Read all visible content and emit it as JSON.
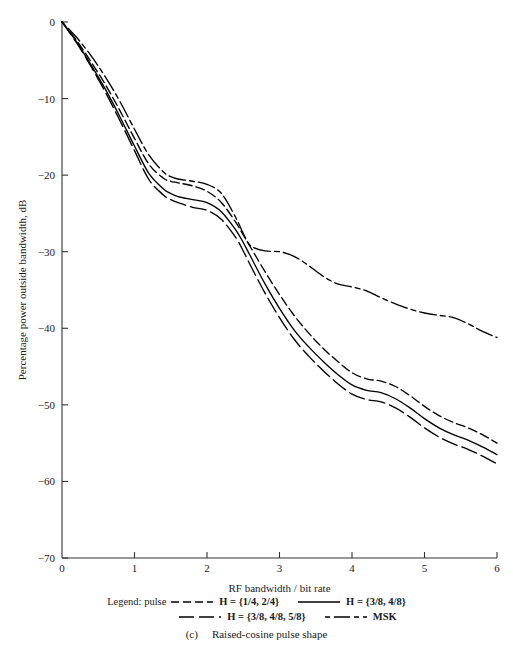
{
  "figure": {
    "caption_letter": "(c)",
    "caption_text": "Raised-cosine pulse shape"
  },
  "legend": {
    "title": "Legend: pulse",
    "entries": [
      {
        "label": "H = {1/4, 2/4}",
        "style": "dashed-medium",
        "row": 1
      },
      {
        "label": "H = {3/8, 4/8}",
        "style": "solid",
        "row": 1
      },
      {
        "label": "H = {3/8, 4/8, 5/8}",
        "style": "dashed-long",
        "row": 2
      },
      {
        "label": "MSK",
        "style": "dash-dot",
        "row": 2
      }
    ]
  },
  "chart_data": {
    "type": "line",
    "title": "",
    "xlabel": "RF bandwidth / bit rate",
    "ylabel": "Percentage power outside bandwidth, dB",
    "xlim": [
      0,
      6
    ],
    "ylim": [
      -70,
      0
    ],
    "xticks": [
      0,
      1,
      2,
      3,
      4,
      5,
      6
    ],
    "xticklabels": [
      "0",
      "1",
      "2",
      "3",
      "4",
      "5",
      "6"
    ],
    "yticks": [
      0,
      -10,
      -20,
      -30,
      -40,
      -50,
      -60,
      -70
    ],
    "yticklabels": [
      "0",
      "−10",
      "−20",
      "−30",
      "−40",
      "−50",
      "−60",
      "−70"
    ],
    "grid": false,
    "legend_position": "below-axes",
    "series": [
      {
        "name": "H = {1/4, 2/4}",
        "style": "dashed-medium",
        "x": [
          0,
          0.2,
          0.4,
          0.6,
          0.8,
          1.0,
          1.2,
          1.4,
          1.5,
          1.6,
          1.8,
          2.0,
          2.2,
          2.4,
          2.5,
          2.6,
          2.8,
          3.0,
          3.2,
          3.4,
          3.6,
          3.8,
          4.0,
          4.2,
          4.4,
          4.6,
          4.8,
          5.0,
          5.2,
          5.4,
          5.6,
          5.8,
          6.0
        ],
        "y": [
          0,
          -2.4,
          -5.2,
          -8.2,
          -11.6,
          -15.2,
          -18.6,
          -20.4,
          -20.8,
          -21.0,
          -21.4,
          -22.1,
          -23.6,
          -26.2,
          -27.8,
          -29.4,
          -32.6,
          -35.6,
          -38.3,
          -40.6,
          -42.6,
          -44.3,
          -45.8,
          -46.6,
          -46.9,
          -47.6,
          -48.8,
          -50.2,
          -51.4,
          -52.3,
          -53.0,
          -53.9,
          -55.0
        ]
      },
      {
        "name": "H = {3/8, 4/8}",
        "style": "solid",
        "x": [
          0,
          0.2,
          0.4,
          0.6,
          0.8,
          1.0,
          1.2,
          1.4,
          1.5,
          1.6,
          1.8,
          2.0,
          2.2,
          2.4,
          2.5,
          2.6,
          2.8,
          3.0,
          3.2,
          3.4,
          3.6,
          3.8,
          4.0,
          4.2,
          4.4,
          4.6,
          4.8,
          5.0,
          5.2,
          5.4,
          5.6,
          5.8,
          6.0
        ],
        "y": [
          0,
          -2.6,
          -5.6,
          -8.8,
          -12.4,
          -16.2,
          -19.8,
          -21.8,
          -22.4,
          -22.8,
          -23.2,
          -23.6,
          -24.8,
          -27.2,
          -28.8,
          -30.6,
          -34.2,
          -37.4,
          -40.2,
          -42.4,
          -44.3,
          -46.0,
          -47.4,
          -48.1,
          -48.4,
          -49.2,
          -50.4,
          -51.8,
          -53.0,
          -53.9,
          -54.6,
          -55.5,
          -56.5
        ]
      },
      {
        "name": "H = {3/8, 4/8, 5/8}",
        "style": "dashed-long",
        "x": [
          0,
          0.2,
          0.4,
          0.6,
          0.8,
          1.0,
          1.2,
          1.4,
          1.5,
          1.6,
          1.8,
          2.0,
          2.2,
          2.4,
          2.5,
          2.6,
          2.8,
          3.0,
          3.2,
          3.4,
          3.6,
          3.8,
          4.0,
          4.2,
          4.4,
          4.6,
          4.8,
          5.0,
          5.2,
          5.4,
          5.6,
          5.8,
          6.0
        ],
        "y": [
          0,
          -2.7,
          -5.8,
          -9.2,
          -12.9,
          -16.8,
          -20.6,
          -22.6,
          -23.2,
          -23.6,
          -24.2,
          -24.6,
          -25.8,
          -28.2,
          -29.9,
          -31.8,
          -35.4,
          -38.6,
          -41.4,
          -43.6,
          -45.5,
          -47.2,
          -48.6,
          -49.3,
          -49.6,
          -50.4,
          -51.6,
          -53.0,
          -54.2,
          -55.1,
          -55.8,
          -56.7,
          -57.7
        ]
      },
      {
        "name": "MSK",
        "style": "dash-dot",
        "x": [
          0,
          0.2,
          0.4,
          0.6,
          0.8,
          1.0,
          1.2,
          1.4,
          1.5,
          1.6,
          1.8,
          2.0,
          2.2,
          2.4,
          2.5,
          2.6,
          2.8,
          3.0,
          3.2,
          3.4,
          3.6,
          3.8,
          4.0,
          4.2,
          4.4,
          4.6,
          4.8,
          5.0,
          5.2,
          5.4,
          5.6,
          5.8,
          6.0
        ],
        "y": [
          0,
          -2.0,
          -4.4,
          -7.2,
          -10.4,
          -14.0,
          -17.4,
          -19.6,
          -20.2,
          -20.5,
          -20.8,
          -21.2,
          -22.4,
          -25.6,
          -27.6,
          -29.2,
          -29.9,
          -30.0,
          -30.6,
          -31.8,
          -33.2,
          -34.2,
          -34.6,
          -35.1,
          -36.0,
          -36.8,
          -37.5,
          -38.0,
          -38.3,
          -38.6,
          -39.4,
          -40.4,
          -41.2
        ]
      }
    ]
  }
}
